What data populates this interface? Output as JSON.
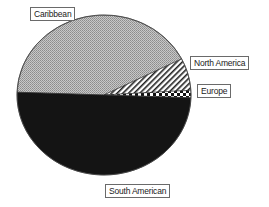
{
  "chart_data": {
    "type": "pie",
    "title": "",
    "legend": "none (slice labels in boxes)",
    "slices": [
      {
        "label": "Caribbean",
        "value": 42,
        "fill": "light gray stipple",
        "color": "#b4b4b4"
      },
      {
        "label": "North America",
        "value": 6.5,
        "fill": "diagonal hatch",
        "color": "#ffffff"
      },
      {
        "label": "Europe",
        "value": 1.5,
        "fill": "checkered",
        "color": "#111111"
      },
      {
        "label": "South American",
        "value": 50,
        "fill": "black",
        "color": "#141414"
      }
    ],
    "units": "percent (estimated)"
  },
  "labels": {
    "caribbean": "Caribbean",
    "north_america": "North America",
    "europe": "Europe",
    "south_american": "South American"
  }
}
